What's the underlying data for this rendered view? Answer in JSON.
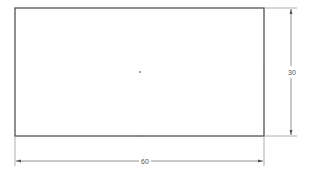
{
  "drawing": {
    "rectangle": {
      "x": 15,
      "y": 8,
      "width": 249,
      "height": 128
    },
    "dimensions": {
      "width_label": "60",
      "height_label": "30"
    },
    "colors": {
      "outline": "#444444",
      "dimension": "#777777",
      "point": "#888888"
    }
  }
}
